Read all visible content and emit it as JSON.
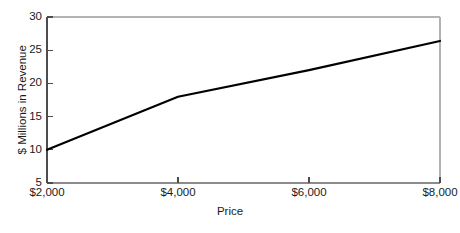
{
  "chart_data": {
    "type": "line",
    "title": "",
    "xlabel": "Price",
    "ylabel": "$ Millions in Revenue",
    "xlim": [
      2000,
      8000
    ],
    "ylim": [
      5,
      30
    ],
    "grid": false,
    "legend": "none",
    "x_tick_labels": [
      "$2,000",
      "$4,000",
      "$6,000",
      "$8,000"
    ],
    "x_tick_values": [
      2000,
      4000,
      6000,
      8000
    ],
    "y_tick_labels": [
      "5",
      "10",
      "15",
      "20",
      "25",
      "30"
    ],
    "y_tick_values": [
      5,
      10,
      15,
      20,
      25,
      30
    ],
    "series": [
      {
        "name": "Revenue",
        "color": "#000000",
        "x": [
          2000,
          4000,
          6000,
          8000
        ],
        "values": [
          10,
          18,
          22,
          26.4
        ]
      }
    ]
  },
  "axes": {
    "x_title": "Price",
    "y_title": "$ Millions in Revenue"
  },
  "ticks": {
    "y": [
      {
        "label": "30"
      },
      {
        "label": "25"
      },
      {
        "label": "20"
      },
      {
        "label": "15"
      },
      {
        "label": "10"
      },
      {
        "label": "5"
      }
    ],
    "x": [
      {
        "label": "$2,000"
      },
      {
        "label": "$4,000"
      },
      {
        "label": "$6,000"
      },
      {
        "label": "$8,000"
      }
    ]
  },
  "colors": {
    "line": "#111111",
    "frame": "#b0b0b0",
    "axis": "#555555",
    "background": "#ffffff"
  }
}
